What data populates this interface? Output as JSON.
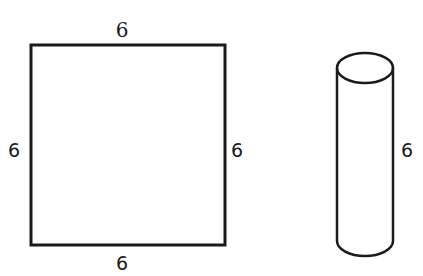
{
  "figure": {
    "square": {
      "label_top": "6",
      "label_left": "6",
      "label_right": "6",
      "label_bottom": "6"
    },
    "cylinder": {
      "label_height": "6"
    }
  },
  "colors": {
    "stroke": "#1a1a1a",
    "background": "#ffffff"
  }
}
